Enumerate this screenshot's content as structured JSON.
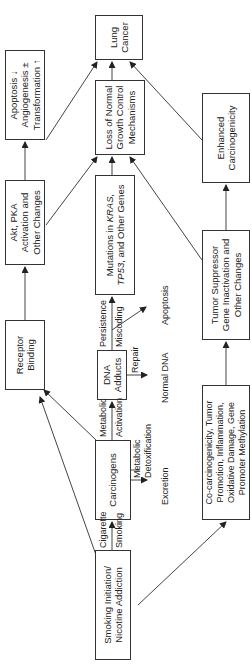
{
  "diagram": {
    "orientation": "rotated 90deg counter-clockwise (flows bottom to top)",
    "nodes": {
      "smoking": "Smoking Initiation/ Nicotine Addiction",
      "carcinogens": "Carcinogens",
      "receptor": "Receptor Binding",
      "akt": "Akt, PKA Activation and Other Changes",
      "apoptosis_box": "Apoptosis ↓ Angiogenesis ± Transformation ↑",
      "dna_adducts": "DNA Adducts",
      "mutations_pre": "Mutations in ",
      "mutations_kras": "KRAS,",
      "mutations_tp53": "TP53",
      "mutations_post": ", and Other Genes",
      "loss": "Loss of Normal Growth Control Mechanisms",
      "lung": "Lung Cancer",
      "cocarc": "Co-carcinogenicity, Tumor Promotion, Inflammation, Oxidative Damage, Gene Promoter Methylation",
      "tumor_supp": "Tumor Suppressor Gene Inactivation and Other Changes",
      "enhanced": "Enhanced Carcinogenicity"
    },
    "edge_labels": {
      "cigarette": "Cigarette",
      "smoking": "Smoking",
      "metabolic_activation_1": "Metabolic",
      "metabolic_activation_2": "Activation",
      "metabolic_detox_1": "Metabolic",
      "metabolic_detox_2": "Detoxification",
      "excretion": "Excretion",
      "persistence": "Persistence",
      "miscoding": "Miscoding",
      "repair": "Repair",
      "normal_dna": "Normal DNA",
      "apoptosis": "Apoptosis"
    }
  }
}
